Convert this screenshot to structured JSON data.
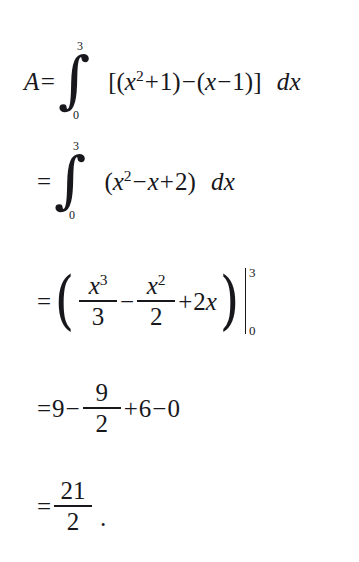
{
  "document": {
    "kind": "math-worked-solution",
    "topic": "definite-integral-area-between-curves",
    "background_color": "#ffffff",
    "text_color": "#17171c"
  },
  "symbols": {
    "equals": "=",
    "integral": "∫",
    "minus": "−",
    "plus": "+",
    "left_paren": "(",
    "right_paren": ")",
    "left_bracket": "[",
    "right_bracket": "]",
    "big_left_paren": "(",
    "big_right_paren": ")",
    "differential": "dx",
    "period": "."
  },
  "lines": [
    {
      "id": "line-1",
      "label": "A",
      "relation": "=",
      "lower_limit": "0",
      "upper_limit": "3",
      "integrand": "[(x²+1)−(x−1)]",
      "differential": "dx",
      "parts": {
        "open_bracket": "[",
        "open_paren_1": "(",
        "x1": "x",
        "exp1": "2",
        "plus": "+",
        "one_a": "1",
        "close_paren_1": ")",
        "minus": "−",
        "open_paren_2": "(",
        "x2": "x",
        "minus2": "−",
        "one_b": "1",
        "close_paren_2": ")",
        "close_bracket": "]"
      }
    },
    {
      "id": "line-2",
      "relation": "=",
      "lower_limit": "0",
      "upper_limit": "3",
      "integrand": "(x²−x+2)",
      "differential": "dx",
      "parts": {
        "open_paren": "(",
        "x1": "x",
        "exp1": "2",
        "minus": "−",
        "x2": "x",
        "plus": "+",
        "two": "2",
        "close_paren": ")"
      }
    },
    {
      "id": "line-3",
      "relation": "=",
      "expression": "(x³/3 − x²/2 + 2x)",
      "eval_lower": "0",
      "eval_upper": "3",
      "terms": {
        "frac1_num_var": "x",
        "frac1_num_exp": "3",
        "frac1_den": "3",
        "minus": "−",
        "frac2_num_var": "x",
        "frac2_num_exp": "2",
        "frac2_den": "2",
        "plus": "+",
        "last_coef": "2",
        "last_var": "x"
      }
    },
    {
      "id": "line-4",
      "relation": "=",
      "expression": "9 − 9/2 + 6 − 0",
      "terms": {
        "nine": "9",
        "minus1": "−",
        "frac_num": "9",
        "frac_den": "2",
        "plus": "+",
        "six": "6",
        "minus2": "−",
        "zero": "0"
      }
    },
    {
      "id": "line-5",
      "relation": "=",
      "expression": "21/2",
      "terms": {
        "frac_num": "21",
        "frac_den": "2",
        "period": "."
      }
    }
  ]
}
